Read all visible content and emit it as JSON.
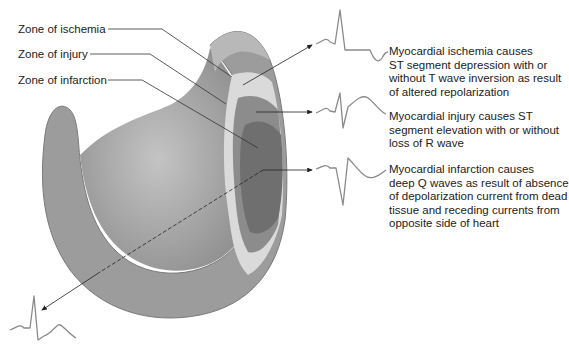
{
  "zones": {
    "ischemia": "Zone of ischemia",
    "injury": "Zone of injury",
    "infarction": "Zone of infarction"
  },
  "descriptions": {
    "ischemia": [
      "Myocardial ischemia causes",
      "ST segment depression with or",
      "without T wave inversion as result",
      "of altered repolarization"
    ],
    "injury": [
      "Myocardial injury causes ST",
      "segment elevation with or without",
      "loss of R wave"
    ],
    "infarction": [
      "Myocardial infarction causes",
      "deep Q waves as result of absence",
      "of depolarization current from dead",
      "tissue and receding currents from",
      "opposite side of heart"
    ]
  },
  "colors": {
    "wall_outer": "#9a9a9a",
    "wall_inner": "#b5b5b5",
    "cavity": "#a8a8a8",
    "ischemia": "#d9d9d9",
    "injury": "#8a8a8a",
    "infarction": "#6e6e6e",
    "ecg": "#8a8a8a",
    "line": "#333333"
  }
}
